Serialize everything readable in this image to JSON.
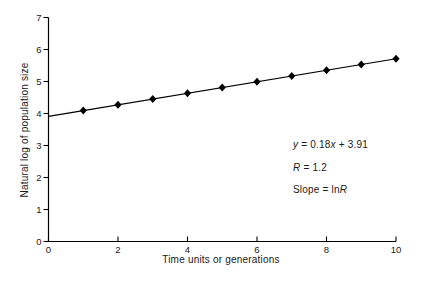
{
  "figure": {
    "background": "#ffffff",
    "ink_color": "#000000",
    "text_color": "#1a1a1a"
  },
  "chart_data": {
    "type": "line",
    "title": "",
    "xlabel": "Time units or generations",
    "ylabel": "Natural log of population size",
    "xlim": [
      0,
      10
    ],
    "ylim": [
      0,
      7
    ],
    "x_ticks": [
      0,
      2,
      4,
      6,
      8,
      10
    ],
    "y_ticks": [
      0,
      1,
      2,
      3,
      4,
      5,
      6,
      7
    ],
    "grid": false,
    "legend": "none",
    "marker": "diamond",
    "marker_color": "#000000",
    "line_color": "#000000",
    "points": {
      "x": [
        1,
        2,
        3,
        4,
        5,
        6,
        7,
        8,
        9,
        10
      ],
      "y": [
        4.09,
        4.27,
        4.45,
        4.63,
        4.81,
        4.99,
        5.17,
        5.35,
        5.53,
        5.71
      ]
    },
    "trend_line": {
      "slope": 0.18,
      "intercept": 3.91,
      "x_start": 0,
      "x_end": 10
    },
    "annotations": [
      {
        "segments": [
          {
            "text": "y",
            "italic": true
          },
          {
            "text": " = 0.18",
            "italic": false
          },
          {
            "text": "x",
            "italic": true
          },
          {
            "text": " + 3.91",
            "italic": false
          }
        ]
      },
      {
        "segments": [
          {
            "text": "R",
            "italic": true
          },
          {
            "text": " = 1.2",
            "italic": false
          }
        ]
      },
      {
        "segments": [
          {
            "text": "Slope = ln",
            "italic": false
          },
          {
            "text": "R",
            "italic": true
          }
        ]
      }
    ]
  }
}
